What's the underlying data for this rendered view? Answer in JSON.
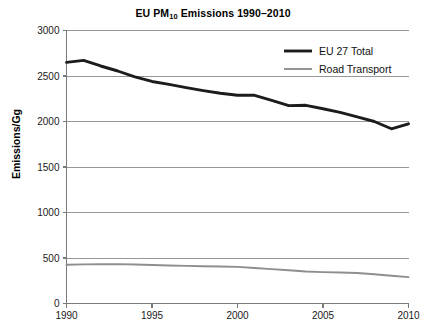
{
  "chart_data": {
    "type": "line",
    "title": "EU PM10 Emissions 1990–2010",
    "title_prefix": "EU PM",
    "title_sub": "10",
    "title_suffix": " Emissions 1990–2010",
    "xlabel": "",
    "ylabel": "Emissions/Gg",
    "xlim": [
      1990,
      2010
    ],
    "ylim": [
      0,
      3000
    ],
    "ytick_step": 500,
    "xtick_step": 5,
    "grid": true,
    "legend_position": "top-right",
    "yticks": [
      0,
      500,
      1000,
      1500,
      2000,
      2500,
      3000
    ],
    "ytick_labels": [
      "0",
      "500",
      "1000",
      "1500",
      "2000",
      "2500",
      "3000"
    ],
    "xticks": [
      1990,
      1995,
      2000,
      2005,
      2010
    ],
    "xtick_labels": [
      "1990",
      "1995",
      "2000",
      "2005",
      "2010"
    ],
    "x": [
      1990,
      1991,
      1992,
      1993,
      1994,
      1995,
      1996,
      1997,
      1998,
      1999,
      2000,
      2001,
      2002,
      2003,
      2004,
      2005,
      2006,
      2007,
      2008,
      2009,
      2010
    ],
    "series": [
      {
        "name": "EU 27 Total",
        "color": "#1c1c1c",
        "line_width": 2.9,
        "values": [
          2650,
          2672,
          2610,
          2555,
          2490,
          2440,
          2408,
          2372,
          2340,
          2310,
          2288,
          2288,
          2232,
          2175,
          2178,
          2140,
          2100,
          2050,
          2000,
          1920,
          1975
        ]
      },
      {
        "name": "Road Transport",
        "color": "#8e8e8e",
        "line_width": 1.9,
        "values": [
          425,
          430,
          432,
          433,
          428,
          423,
          418,
          414,
          410,
          407,
          402,
          390,
          378,
          365,
          352,
          345,
          340,
          335,
          322,
          305,
          290
        ]
      }
    ]
  },
  "legend": {
    "items": [
      {
        "label": "EU 27 Total",
        "color": "#1c1c1c",
        "width": 2.9
      },
      {
        "label": "Road Transport",
        "color": "#8e8e8e",
        "width": 1.9
      }
    ]
  }
}
